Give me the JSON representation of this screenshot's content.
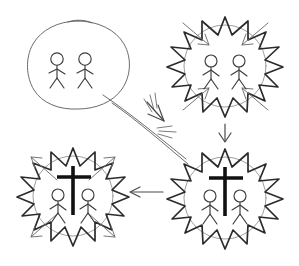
{
  "canvas": {
    "width": 299,
    "height": 266,
    "background": "#ffffff",
    "ink_color": "#2b2b2b",
    "faint_ink_color": "#8c8c8c",
    "cross_color": "#111111",
    "style": "hand-drawn-sketch"
  },
  "panels": [
    {
      "id": "calm-group",
      "name": "calm-group-panel",
      "position": "top-left",
      "outline": "smooth-oval",
      "center": {
        "x": 75,
        "y": 63
      },
      "figures": 2,
      "has_cross": false,
      "has_radiating_arrows": false
    },
    {
      "id": "agitated-group",
      "name": "agitated-group-panel",
      "position": "top-right",
      "outline": "spiky-star",
      "center": {
        "x": 225,
        "y": 66
      },
      "figures": 2,
      "has_cross": false,
      "has_radiating_arrows": true,
      "arrow_direction": "inward"
    },
    {
      "id": "cross-group-right",
      "name": "cross-group-panel-right",
      "position": "bottom-right",
      "outline": "spiky-star",
      "center": {
        "x": 225,
        "y": 198
      },
      "figures": 2,
      "has_cross": true,
      "has_radiating_arrows": false
    },
    {
      "id": "cross-group-left",
      "name": "cross-group-panel-left",
      "position": "bottom-left",
      "outline": "spiky-star",
      "center": {
        "x": 73,
        "y": 196
      },
      "figures": 2,
      "has_cross": true,
      "has_radiating_arrows": true,
      "arrow_direction": "outward"
    }
  ],
  "connectors": [
    {
      "id": "diagonal-double-line",
      "name": "diagonal-collision-connector",
      "from": "calm-group",
      "to": "cross-group-right",
      "style": "double-line-with-impact-burst",
      "arrowhead": "up-left-midpoint"
    },
    {
      "id": "down-arrow",
      "name": "downward-connector",
      "from": "agitated-group",
      "to": "cross-group-right",
      "style": "single-arrow",
      "direction": "down"
    },
    {
      "id": "left-arrow",
      "name": "leftward-connector",
      "from": "cross-group-right",
      "to": "cross-group-left",
      "style": "single-arrow",
      "direction": "left"
    }
  ]
}
